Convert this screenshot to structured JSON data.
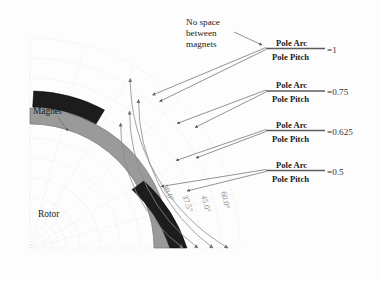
{
  "figure": {
    "colors": {
      "rotor": "#9a9a9a",
      "magnet": "#1c1c1c",
      "arc": "#8c8c8c",
      "grid": "#d2cfd0",
      "leader": "#6f6f6f",
      "text": "#1a1a1a",
      "angle_text": "#8e8e8e"
    }
  },
  "annotations": {
    "no_space_note": {
      "line1": "No space",
      "line2": "between",
      "line3": "magnets"
    },
    "magnet_label": "Magnet",
    "rotor_label": "Rotor"
  },
  "ratios": [
    {
      "numerator": "Pole Arc",
      "denominator": "Pole Pitch",
      "value": "=1",
      "angle_label": "60.0°"
    },
    {
      "numerator": "Pole Arc",
      "denominator": "Pole Pitch",
      "value": "=0.75",
      "angle_label": "45.0°"
    },
    {
      "numerator": "Pole Arc",
      "denominator": "Pole Pitch",
      "value": "=0.625",
      "angle_label": "37.5°"
    },
    {
      "numerator": "Pole Arc",
      "denominator": "Pole Pitch",
      "value": "=0.5",
      "angle_label": "30.0°"
    }
  ],
  "angle_markers": [
    {
      "label": "30.0°"
    },
    {
      "label": "37.5°"
    },
    {
      "label": "45.0°"
    },
    {
      "label": "60.0°"
    }
  ]
}
